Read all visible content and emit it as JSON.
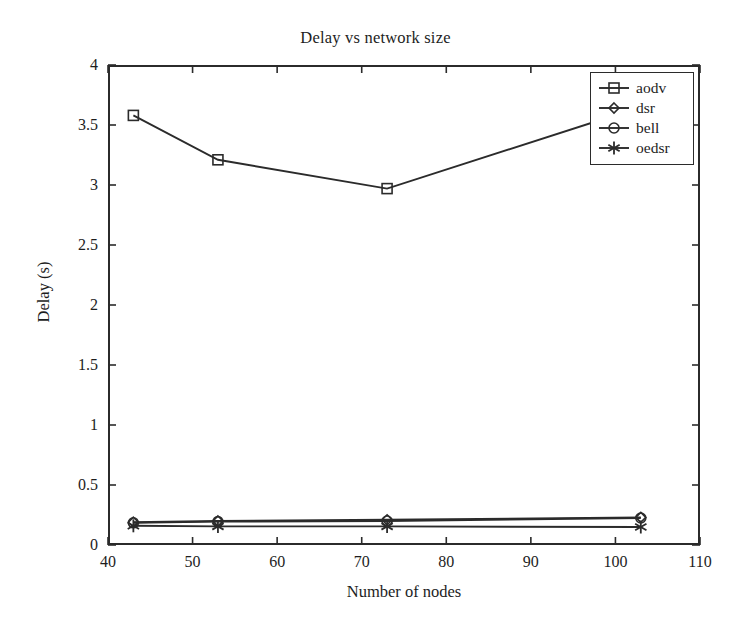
{
  "chart_data": {
    "type": "line",
    "title": "Delay vs network size",
    "xlabel": "Number of nodes",
    "ylabel": "Delay (s)",
    "xlim": [
      40,
      110
    ],
    "ylim": [
      0,
      4
    ],
    "xticks": [
      40,
      50,
      60,
      70,
      80,
      90,
      100,
      110
    ],
    "yticks": [
      0,
      0.5,
      1,
      1.5,
      2,
      2.5,
      3,
      3.5,
      4
    ],
    "ytick_labels": [
      "0",
      "0.5",
      "1",
      "1.5",
      "2",
      "2.5",
      "3",
      "3.5",
      "4"
    ],
    "xtick_labels": [
      "40",
      "50",
      "60",
      "70",
      "80",
      "90",
      "100",
      "110"
    ],
    "grid": false,
    "legend_position": "top-right",
    "x": [
      43,
      53,
      73,
      103
    ],
    "series": [
      {
        "name": "aodv",
        "marker": "square",
        "values": [
          3.58,
          3.21,
          2.97,
          3.65
        ]
      },
      {
        "name": "dsr",
        "marker": "diamond",
        "values": [
          0.19,
          0.2,
          0.21,
          0.23
        ]
      },
      {
        "name": "bell",
        "marker": "circle",
        "values": [
          0.185,
          0.195,
          0.2,
          0.225
        ]
      },
      {
        "name": "oedsr",
        "marker": "asterisk",
        "values": [
          0.16,
          0.155,
          0.155,
          0.15
        ]
      }
    ]
  },
  "colors": {
    "line": "#2b2b2b",
    "axis": "#2b2b2b",
    "text": "#1d1d1d",
    "background": "#ffffff"
  }
}
